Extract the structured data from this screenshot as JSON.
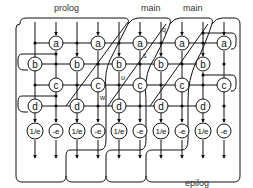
{
  "diagram": {
    "title_labels": {
      "prolog": "prolog",
      "main1": "main",
      "main2": "main",
      "epilog": "epilog"
    },
    "annotations": {
      "q": "q",
      "s": "s",
      "u": "u",
      "w": "w"
    },
    "node_labels": {
      "a": "a",
      "b": "b",
      "c": "c",
      "d": "d",
      "inv_e": "1/e",
      "neg_e": "-e"
    },
    "colors": {
      "stroke": "#111111",
      "background": "#ffffff"
    },
    "columns": [
      35,
      56,
      77,
      98,
      119,
      140,
      161,
      182,
      203,
      224
    ],
    "rows": {
      "a": 43,
      "b": 64,
      "c": 85,
      "d": 106,
      "e": 131
    }
  }
}
